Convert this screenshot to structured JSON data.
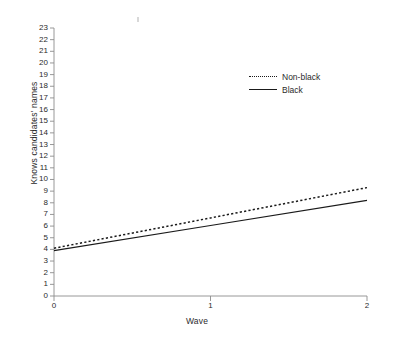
{
  "chart_data": {
    "type": "line",
    "title": "",
    "xlabel": "Wave",
    "ylabel": "Knows candidates' names",
    "x": [
      0,
      1,
      2
    ],
    "xlim": [
      0,
      2
    ],
    "ylim": [
      0,
      23
    ],
    "xticks": [
      "0",
      "1",
      "2"
    ],
    "yticks": [
      "0",
      "1",
      "2",
      "3",
      "4",
      "5",
      "6",
      "7",
      "8",
      "9",
      "10",
      "11",
      "12",
      "13",
      "14",
      "15",
      "16",
      "17",
      "18",
      "19",
      "20",
      "21",
      "22",
      "23"
    ],
    "grid": false,
    "legend_position": "upper right",
    "series": [
      {
        "name": "Non-black",
        "style": "dotted",
        "color": "#1a1a1a",
        "values": [
          4.1,
          6.7,
          9.3
        ]
      },
      {
        "name": "Black",
        "style": "solid",
        "color": "#1a1a1a",
        "values": [
          3.9,
          6.05,
          8.2
        ]
      }
    ]
  },
  "axis": {
    "line_color": "#8c8c8c"
  }
}
